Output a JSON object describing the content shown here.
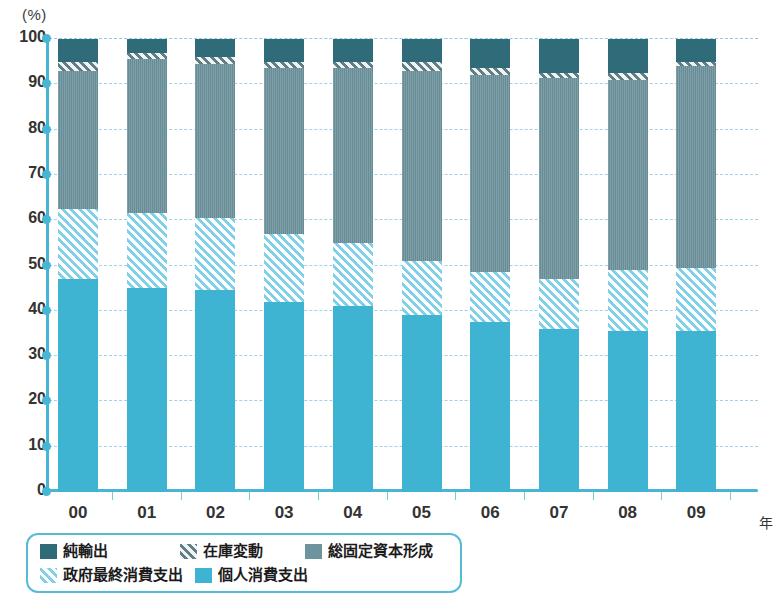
{
  "chart_data": {
    "type": "bar",
    "subtype": "stacked-bar-100",
    "title": "",
    "xlabel": "年",
    "ylabel": "(%)",
    "ylim": [
      0,
      100
    ],
    "yticks": [
      0,
      10,
      20,
      30,
      40,
      50,
      60,
      70,
      80,
      90,
      100
    ],
    "grid": true,
    "legend_position": "bottom-left",
    "categories": [
      "00",
      "01",
      "02",
      "03",
      "04",
      "05",
      "06",
      "07",
      "08",
      "09"
    ],
    "series": [
      {
        "name": "個人消費支出",
        "key": "pc",
        "color": "#3fb3d2",
        "pattern": "solid",
        "values": [
          47.0,
          45.0,
          44.5,
          42.0,
          41.0,
          39.0,
          37.5,
          36.0,
          35.5,
          35.5
        ]
      },
      {
        "name": "政府最終消費支出",
        "key": "gc",
        "color": "#7fd0e8",
        "pattern": "diagonal-hatch-light",
        "values": [
          15.5,
          16.5,
          16.0,
          15.0,
          14.0,
          12.0,
          11.0,
          11.0,
          13.5,
          14.0
        ]
      },
      {
        "name": "総固定資本形成",
        "key": "gf",
        "color": "#6d939d",
        "pattern": "solid",
        "values": [
          30.5,
          34.0,
          34.0,
          36.5,
          38.5,
          42.0,
          43.5,
          44.5,
          42.0,
          44.5
        ]
      },
      {
        "name": "在庫変動",
        "key": "inv",
        "color": "#5d7f8a",
        "pattern": "diagonal-hatch-dark",
        "values": [
          2.0,
          1.5,
          1.5,
          1.5,
          1.5,
          2.0,
          1.5,
          1.0,
          1.5,
          1.0
        ]
      },
      {
        "name": "純輸出",
        "key": "nx",
        "color": "#2f6b78",
        "pattern": "solid",
        "values": [
          5.0,
          3.0,
          4.0,
          5.0,
          5.0,
          5.0,
          6.5,
          7.5,
          7.5,
          5.0
        ]
      }
    ]
  },
  "axis": {
    "unit_label": "(%)",
    "year_unit": "年",
    "y_tick_labels": [
      "100",
      "90",
      "80",
      "70",
      "60",
      "50",
      "40",
      "30",
      "20",
      "10",
      "0"
    ],
    "x_tick_labels": [
      "00",
      "01",
      "02",
      "03",
      "04",
      "05",
      "06",
      "07",
      "08",
      "09"
    ],
    "axis_color": "#46b6d4",
    "grid_color": "#9fd4e6"
  },
  "legend": {
    "border_color": "#55bcd8",
    "row1": [
      {
        "label": "純輸出",
        "color": "#2f6b78",
        "pattern": "solid"
      },
      {
        "label": "在庫変動",
        "color": "#5d7f8a",
        "pattern": "diagonal-hatch-dark"
      },
      {
        "label": "総固定資本形成",
        "color": "#6d939d",
        "pattern": "solid"
      }
    ],
    "row2": [
      {
        "label": "政府最終消費支出",
        "color": "#7fd0e8",
        "pattern": "diagonal-hatch-light"
      },
      {
        "label": "個人消費支出",
        "color": "#3fb3d2",
        "pattern": "solid"
      }
    ]
  }
}
